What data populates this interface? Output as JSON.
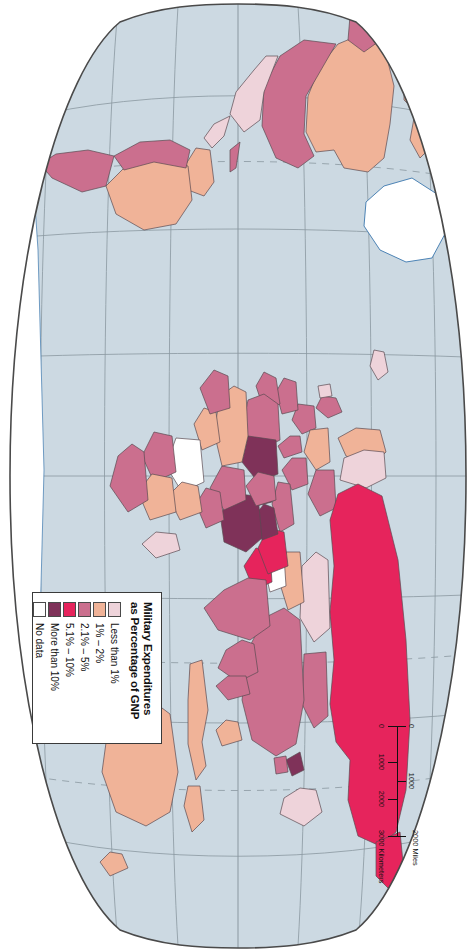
{
  "map": {
    "title": "Military Expenditures as Percentage of GNP",
    "projection": "interrupted-oval world map",
    "orientation_note": "map graphic rotated 90 degrees clockwise within the portrait frame",
    "ocean_color": "#ccd9e2",
    "graticule_color": "#7e8b94",
    "coast_color": "#3b77ae",
    "border_color": "#5a4a52",
    "neatline_color": "#4a4a4a",
    "page_background": "#ffffff"
  },
  "legend": {
    "title_line1": "Military Expenditures",
    "title_line2": "as Percentage of GNP",
    "items": [
      {
        "label": "Less than 1%",
        "color": "#eed3da"
      },
      {
        "label": "1% – 2%",
        "color": "#f0b398"
      },
      {
        "label": "2.1% – 5%",
        "color": "#cb6f8e"
      },
      {
        "label": "5.1% – 10%",
        "color": "#e6245c"
      },
      {
        "label": "More than 10%",
        "color": "#7f3259"
      },
      {
        "label": "No data",
        "color": "#ffffff"
      }
    ]
  },
  "scale_bar": {
    "miles": {
      "unit_label": "Miles",
      "unit_suffix": "2000 Miles",
      "ticks": [
        "0",
        "1000",
        "2000"
      ]
    },
    "kilometers": {
      "unit_label": "Kilometers",
      "unit_suffix": "3000 Kilometers",
      "ticks": [
        "0",
        "1000",
        "2000",
        "3000"
      ]
    }
  },
  "chart_data": {
    "type": "map",
    "title": "Military Expenditures as Percentage of GNP",
    "classes": [
      "Less than 1%",
      "1% – 2%",
      "2.1% – 5%",
      "5.1% – 10%",
      "More than 10%",
      "No data"
    ],
    "class_colors": [
      "#eed3da",
      "#f0b398",
      "#cb6f8e",
      "#e6245c",
      "#7f3259",
      "#ffffff"
    ],
    "regions": [
      {
        "name": "Russia",
        "class": "5.1% – 10%",
        "color": "#e6245c"
      },
      {
        "name": "Canada",
        "class": "1% – 2%",
        "color": "#f0b398"
      },
      {
        "name": "United States",
        "class": "2.1% – 5%",
        "color": "#cb6f8e"
      },
      {
        "name": "Greenland",
        "class": "No data",
        "color": "#ffffff"
      },
      {
        "name": "Mexico",
        "class": "Less than 1%",
        "color": "#eed3da"
      },
      {
        "name": "Brazil",
        "class": "1% – 2%",
        "color": "#f0b398"
      },
      {
        "name": "Argentina",
        "class": "2.1% – 5%",
        "color": "#cb6f8e"
      },
      {
        "name": "Saudi Arabia",
        "class": "More than 10%",
        "color": "#7f3259"
      },
      {
        "name": "Iraq",
        "class": "More than 10%",
        "color": "#7f3259"
      },
      {
        "name": "Iran",
        "class": "5.1% – 10%",
        "color": "#e6245c"
      },
      {
        "name": "Israel",
        "class": "More than 10%",
        "color": "#7f3259"
      },
      {
        "name": "Egypt",
        "class": "2.1% – 5%",
        "color": "#cb6f8e"
      },
      {
        "name": "Libya",
        "class": "More than 10%",
        "color": "#7f3259"
      },
      {
        "name": "Algeria",
        "class": "2.1% – 5%",
        "color": "#cb6f8e"
      },
      {
        "name": "China",
        "class": "2.1% – 5%",
        "color": "#cb6f8e"
      },
      {
        "name": "India",
        "class": "2.1% – 5%",
        "color": "#cb6f8e"
      },
      {
        "name": "Pakistan",
        "class": "5.1% – 10%",
        "color": "#e6245c"
      },
      {
        "name": "Afghanistan",
        "class": "No data",
        "color": "#ffffff"
      },
      {
        "name": "Mongolia",
        "class": "2.1% – 5%",
        "color": "#cb6f8e"
      },
      {
        "name": "Kazakhstan",
        "class": "Less than 1%",
        "color": "#eed3da"
      },
      {
        "name": "Japan",
        "class": "Less than 1%",
        "color": "#eed3da"
      },
      {
        "name": "North Korea",
        "class": "More than 10%",
        "color": "#7f3259"
      },
      {
        "name": "Australia",
        "class": "1% – 2%",
        "color": "#f0b398"
      },
      {
        "name": "Indonesia",
        "class": "1% – 2%",
        "color": "#f0b398"
      },
      {
        "name": "Papua New Guinea",
        "class": "1% – 2%",
        "color": "#f0b398"
      },
      {
        "name": "South Africa",
        "class": "2.1% – 5%",
        "color": "#cb6f8e"
      },
      {
        "name": "Angola",
        "class": "2.1% – 5%",
        "color": "#cb6f8e"
      },
      {
        "name": "Dem. Rep. Congo",
        "class": "No data",
        "color": "#ffffff"
      },
      {
        "name": "Nigeria",
        "class": "1% – 2%",
        "color": "#f0b398"
      },
      {
        "name": "United Kingdom",
        "class": "2.1% – 5%",
        "color": "#cb6f8e"
      },
      {
        "name": "France",
        "class": "2.1% – 5%",
        "color": "#cb6f8e"
      },
      {
        "name": "Germany",
        "class": "1% – 2%",
        "color": "#f0b398"
      },
      {
        "name": "Turkey",
        "class": "2.1% – 5%",
        "color": "#cb6f8e"
      },
      {
        "name": "Antarctica",
        "class": "No data",
        "color": "#ffffff"
      }
    ]
  }
}
